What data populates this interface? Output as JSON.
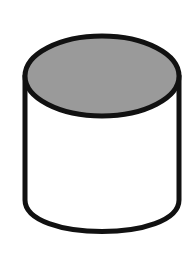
{
  "diagram": {
    "type": "cylinder",
    "colors": {
      "background": "#ffffff",
      "top_fill": "#9a9a9a",
      "body_fill": "#ffffff",
      "stroke": "#111111"
    },
    "stroke_width": 5,
    "top_ellipse": {
      "cx": 102,
      "cy": 76,
      "rx": 77,
      "ry": 40
    },
    "body": {
      "left_x": 25,
      "right_x": 179,
      "top_y": 76,
      "side_bottom_y": 200,
      "bottom_y": 240
    }
  }
}
